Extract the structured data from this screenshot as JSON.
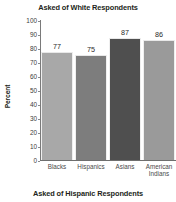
{
  "titles": {
    "top": "Asked of White Respondents",
    "bottom": "Asked of Hispanic Respondents"
  },
  "axis": {
    "ylabel": "Percent",
    "yticks": [
      "100",
      "90",
      "80",
      "70",
      "60",
      "50",
      "40",
      "30",
      "20",
      "10",
      "0"
    ]
  },
  "chart_data": {
    "type": "bar",
    "title": "Asked of White Respondents",
    "subtitle": "Asked of Hispanic Respondents",
    "categories": [
      "Blacks",
      "Hispanics",
      "Asians",
      "American\nIndians"
    ],
    "values": [
      77,
      75,
      87,
      86
    ],
    "labels": [
      "77",
      "75",
      "87",
      "86"
    ],
    "xlabel": "",
    "ylabel": "Percent",
    "ylim": [
      0,
      100
    ],
    "ytick_step": 10,
    "grid": false,
    "legend": false,
    "bar_colors": [
      "#a8a8a8",
      "#7d7d7d",
      "#4f4f4f",
      "#9a9a9a"
    ]
  }
}
